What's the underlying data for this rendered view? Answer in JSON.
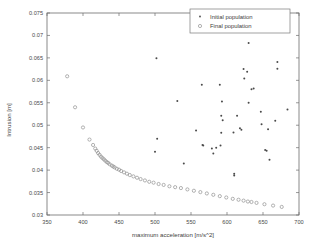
{
  "chart_data": {
    "type": "scatter",
    "title": "",
    "xlabel": "maximum acceleration [m/s^2]",
    "ylabel": "Intrusion [m]",
    "xlim": [
      350,
      700
    ],
    "ylim": [
      0.03,
      0.075
    ],
    "xticks": [
      350,
      400,
      450,
      500,
      550,
      600,
      650,
      700
    ],
    "yticks": [
      0.03,
      0.035,
      0.04,
      0.045,
      0.05,
      0.055,
      0.06,
      0.065,
      0.07,
      0.075
    ],
    "xtick_labels": [
      "350",
      "400",
      "450",
      "500",
      "550",
      "600",
      "650",
      "700"
    ],
    "ytick_labels": [
      "0.03",
      "0.035",
      "0.04",
      "0.045",
      "0.05",
      "0.055",
      "0.06",
      "0.065",
      "0.07",
      "0.075"
    ],
    "grid": false,
    "legend_position": "top-right",
    "series": [
      {
        "name": "Initial population",
        "marker": "dot",
        "color": "#4a4a4a",
        "points": [
          [
            502,
            0.0649
          ],
          [
            630,
            0.0683
          ],
          [
            623,
            0.0625
          ],
          [
            670,
            0.0641
          ],
          [
            670,
            0.0626
          ],
          [
            628,
            0.0619
          ],
          [
            624,
            0.0604
          ],
          [
            565,
            0.059
          ],
          [
            590,
            0.059
          ],
          [
            634,
            0.058
          ],
          [
            637,
            0.0582
          ],
          [
            531,
            0.0554
          ],
          [
            593,
            0.0553
          ],
          [
            630,
            0.055
          ],
          [
            684,
            0.0535
          ],
          [
            647,
            0.053
          ],
          [
            592,
            0.0521
          ],
          [
            614,
            0.0521
          ],
          [
            667,
            0.051
          ],
          [
            594,
            0.0511
          ],
          [
            648,
            0.0502
          ],
          [
            657,
            0.0491
          ],
          [
            618,
            0.0493
          ],
          [
            620,
            0.049
          ],
          [
            557,
            0.0488
          ],
          [
            609,
            0.0484
          ],
          [
            592,
            0.0483
          ],
          [
            503,
            0.047
          ],
          [
            566,
            0.0456
          ],
          [
            567,
            0.0455
          ],
          [
            591,
            0.0455
          ],
          [
            585,
            0.045
          ],
          [
            579,
            0.0448
          ],
          [
            653,
            0.0445
          ],
          [
            655,
            0.0443
          ],
          [
            500,
            0.0441
          ],
          [
            581,
            0.0437
          ],
          [
            659,
            0.0423
          ],
          [
            540,
            0.0415
          ],
          [
            610,
            0.0392
          ],
          [
            610,
            0.0388
          ]
        ]
      },
      {
        "name": "Final population",
        "marker": "circle",
        "color": "#8a8a8a",
        "points": [
          [
            378,
            0.0609
          ],
          [
            389,
            0.054
          ],
          [
            400,
            0.0495
          ],
          [
            409,
            0.0468
          ],
          [
            414,
            0.0456
          ],
          [
            417,
            0.0448
          ],
          [
            419,
            0.0443
          ],
          [
            421,
            0.0438
          ],
          [
            423,
            0.0434
          ],
          [
            425,
            0.043
          ],
          [
            427,
            0.0427
          ],
          [
            429,
            0.0424
          ],
          [
            431,
            0.0421
          ],
          [
            433,
            0.0418
          ],
          [
            435,
            0.0416
          ],
          [
            437,
            0.0413
          ],
          [
            440,
            0.041
          ],
          [
            442,
            0.0408
          ],
          [
            444,
            0.0406
          ],
          [
            447,
            0.0403
          ],
          [
            450,
            0.0401
          ],
          [
            453,
            0.0398
          ],
          [
            457,
            0.0395
          ],
          [
            461,
            0.0392
          ],
          [
            465,
            0.0389
          ],
          [
            470,
            0.0386
          ],
          [
            475,
            0.0383
          ],
          [
            480,
            0.038
          ],
          [
            486,
            0.0377
          ],
          [
            492,
            0.0374
          ],
          [
            498,
            0.0372
          ],
          [
            505,
            0.0369
          ],
          [
            512,
            0.0367
          ],
          [
            520,
            0.0364
          ],
          [
            528,
            0.0362
          ],
          [
            536,
            0.036
          ],
          [
            545,
            0.0357
          ],
          [
            554,
            0.0354
          ],
          [
            563,
            0.0351
          ],
          [
            572,
            0.0348
          ],
          [
            581,
            0.0345
          ],
          [
            590,
            0.0342
          ],
          [
            599,
            0.0339
          ],
          [
            608,
            0.0336
          ],
          [
            616,
            0.0334
          ],
          [
            623,
            0.0332
          ],
          [
            629,
            0.033
          ],
          [
            634,
            0.0329
          ],
          [
            641,
            0.0327
          ],
          [
            652,
            0.0324
          ],
          [
            664,
            0.0321
          ],
          [
            676,
            0.0318
          ]
        ]
      }
    ]
  },
  "legend": {
    "entries": [
      {
        "label": "Initial population",
        "marker": "dot"
      },
      {
        "label": "Final population",
        "marker": "circle"
      }
    ]
  }
}
